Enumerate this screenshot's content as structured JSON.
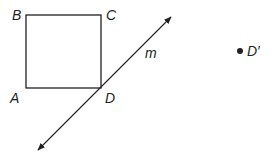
{
  "diagram": {
    "points": {
      "A": "A",
      "B": "B",
      "C": "C",
      "D": "D",
      "D_prime": "D′"
    },
    "line_label": "m",
    "colors": {
      "stroke": "#231f20",
      "background": "#ffffff"
    }
  }
}
